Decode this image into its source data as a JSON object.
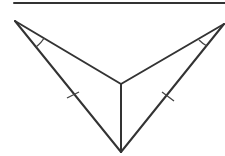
{
  "diagram": {
    "title": "",
    "colors": {
      "stroke": "#333333",
      "background": "#ffffff"
    },
    "elements": {
      "top_line": "horizontal line",
      "segments": [
        "left-upper side",
        "right-upper side",
        "vertical center segment",
        "left-lower side",
        "right-lower side"
      ],
      "tick_marks": [
        "single tick on left-lower side",
        "single tick on right-lower side"
      ],
      "angle_marks": [
        "angle arc at left vertex",
        "angle arc at right vertex"
      ]
    }
  }
}
